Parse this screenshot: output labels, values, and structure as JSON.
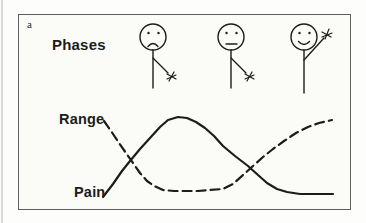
{
  "panel": {
    "label": "a"
  },
  "labels": {
    "phases": "Phases",
    "range": "Range",
    "pain": "Pain"
  },
  "figures": [
    {
      "name": "phase-figure-1",
      "expression": "sad",
      "arm": "lowered"
    },
    {
      "name": "phase-figure-2",
      "expression": "neutral",
      "arm": "lowered"
    },
    {
      "name": "phase-figure-3",
      "expression": "happy",
      "arm": "raised-waving"
    }
  ],
  "colors": {
    "line": "#1c1c1c",
    "frame_border": "#5f5f5f",
    "background": "#fbfbf8"
  },
  "chart_data": {
    "type": "line",
    "title": "",
    "xlabel": "",
    "ylabel": "",
    "axes": "none (conceptual curves inside plain frame)",
    "legend": "inline labels: Range (dashed), Pain (solid)",
    "series": [
      {
        "name": "Pain",
        "style": "solid",
        "points": [
          [
            103,
            197
          ],
          [
            113,
            184
          ],
          [
            122,
            171
          ],
          [
            130,
            161
          ],
          [
            140,
            149
          ],
          [
            150,
            138
          ],
          [
            160,
            127
          ],
          [
            168,
            120
          ],
          [
            178,
            117
          ],
          [
            187,
            118
          ],
          [
            196,
            122
          ],
          [
            205,
            128
          ],
          [
            214,
            136
          ],
          [
            223,
            146
          ],
          [
            235,
            156
          ],
          [
            248,
            166
          ],
          [
            258,
            175
          ],
          [
            267,
            183
          ],
          [
            277,
            189
          ],
          [
            287,
            192
          ],
          [
            300,
            194
          ],
          [
            315,
            194
          ],
          [
            333,
            194
          ]
        ]
      },
      {
        "name": "Range",
        "style": "dashed",
        "points": [
          [
            104,
            121
          ],
          [
            111,
            131
          ],
          [
            119,
            143
          ],
          [
            126,
            153
          ],
          [
            133,
            163
          ],
          [
            140,
            173
          ],
          [
            147,
            181
          ],
          [
            154,
            186
          ],
          [
            163,
            190
          ],
          [
            174,
            191
          ],
          [
            186,
            191
          ],
          [
            198,
            191
          ],
          [
            210,
            190
          ],
          [
            223,
            189
          ],
          [
            233,
            184
          ],
          [
            243,
            175
          ],
          [
            253,
            166
          ],
          [
            263,
            157
          ],
          [
            273,
            149
          ],
          [
            284,
            141
          ],
          [
            296,
            133
          ],
          [
            308,
            127
          ],
          [
            319,
            123
          ],
          [
            332,
            120
          ]
        ]
      }
    ]
  }
}
